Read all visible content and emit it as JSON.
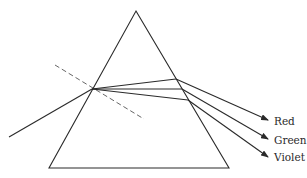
{
  "diagram": {
    "prism": {
      "apex": [
        136,
        11
      ],
      "base_left": [
        49,
        168
      ],
      "base_right": [
        229,
        168
      ]
    },
    "normal_line": {
      "from": [
        55,
        65
      ],
      "to": [
        144,
        119
      ],
      "style": "dashed"
    },
    "incident_ray": {
      "from": [
        9,
        137
      ],
      "to": [
        92,
        89
      ]
    },
    "rays": [
      {
        "name": "Red",
        "internal_to": [
          176,
          79
        ],
        "exit_to": [
          268,
          120
        ]
      },
      {
        "name": "Green",
        "internal_to": [
          182,
          89
        ],
        "exit_to": [
          268,
          139
        ]
      },
      {
        "name": "Violet",
        "internal_to": [
          188,
          100
        ],
        "exit_to": [
          268,
          157
        ]
      }
    ],
    "labels": [
      {
        "text": "Red",
        "x": 274,
        "y": 116
      },
      {
        "text": "Green",
        "x": 274,
        "y": 135
      },
      {
        "text": "Violet",
        "x": 274,
        "y": 152
      }
    ],
    "colors": {
      "line": "#2a2a2a",
      "dashed": "#555555",
      "background": "#ffffff"
    }
  }
}
